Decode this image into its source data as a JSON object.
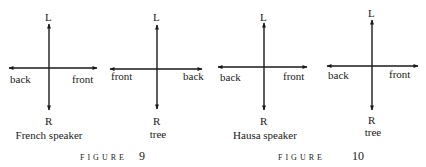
{
  "diagrams": [
    {
      "top": "L",
      "bottom": "R",
      "left": "back",
      "right": "front",
      "caption": "French speaker"
    },
    {
      "top": "L",
      "bottom": "R",
      "left": "front",
      "right": "back",
      "caption": "tree"
    },
    {
      "top": "L",
      "bottom": "R",
      "left": "back",
      "right": "front",
      "caption": "Hausa speaker"
    },
    {
      "top": "L",
      "bottom": "R",
      "left": "back",
      "right": "front",
      "caption": "tree"
    }
  ],
  "figures": [
    {
      "label": "FIGURE",
      "number": "9"
    },
    {
      "label": "FIGURE",
      "number": "10"
    }
  ]
}
